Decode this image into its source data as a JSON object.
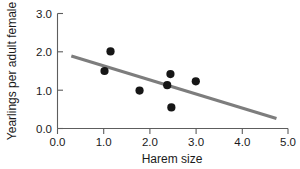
{
  "chart_data": {
    "type": "scatter",
    "title": "",
    "xlabel": "Harem size",
    "ylabel": "Yearlings per adult female",
    "xlim": [
      0.0,
      5.0
    ],
    "ylim": [
      0.0,
      3.0
    ],
    "xticks": [
      0.0,
      1.0,
      2.0,
      3.0,
      4.0,
      5.0
    ],
    "yticks": [
      0.0,
      1.0,
      2.0,
      3.0
    ],
    "xtick_labels": [
      "0.0",
      "1.0",
      "2.0",
      "3.0",
      "4.0",
      "5.0"
    ],
    "ytick_labels": [
      "0.0",
      "1.0",
      "2.0",
      "3.0"
    ],
    "grid": false,
    "legend": null,
    "series": [
      {
        "name": "observations",
        "marker": "filled-circle",
        "color": "#161616",
        "points": [
          {
            "x": 1.02,
            "y": 1.5
          },
          {
            "x": 1.15,
            "y": 2.01
          },
          {
            "x": 1.78,
            "y": 0.99
          },
          {
            "x": 2.38,
            "y": 1.13
          },
          {
            "x": 2.45,
            "y": 1.42
          },
          {
            "x": 2.47,
            "y": 0.55
          },
          {
            "x": 3.0,
            "y": 1.23
          }
        ]
      },
      {
        "name": "regression-line",
        "type": "line",
        "color": "#7d7d7d",
        "x_start": 0.3,
        "y_start": 1.89,
        "x_end": 4.75,
        "y_end": 0.26
      }
    ]
  },
  "axes": {
    "x_title": "Harem size",
    "y_title": "Yearlings per adult female"
  }
}
